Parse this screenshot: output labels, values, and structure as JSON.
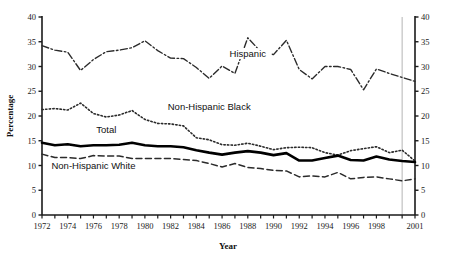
{
  "chart_data": {
    "type": "line",
    "title": "",
    "xlabel": "Year",
    "ylabel": "Percentage",
    "xlim": [
      1972,
      2001
    ],
    "ylim": [
      0,
      40
    ],
    "ytick_step": 5,
    "yticks": [
      0,
      5,
      10,
      15,
      20,
      25,
      30,
      35,
      40
    ],
    "xticks": [
      1972,
      1973,
      1974,
      1975,
      1976,
      1977,
      1978,
      1979,
      1980,
      1981,
      1982,
      1983,
      1984,
      1985,
      1986,
      1987,
      1988,
      1989,
      1990,
      1991,
      1992,
      1993,
      1994,
      1995,
      1996,
      1997,
      1998,
      1999,
      2000,
      2001
    ],
    "xtick_labels": [
      "1972",
      "",
      "1974",
      "",
      "1976",
      "",
      "1978",
      "",
      "1980",
      "",
      "1982",
      "",
      "1984",
      "",
      "1986",
      "",
      "1988",
      "",
      "1990",
      "",
      "1992",
      "",
      "1994",
      "",
      "1996",
      "",
      "1998",
      "",
      "",
      "2001"
    ],
    "grid": false,
    "legend_position": "inline-annotations",
    "dual_axis": true,
    "right_axis_ticks": [
      0,
      5,
      10,
      15,
      20,
      25,
      30,
      35,
      40
    ],
    "break_marker": {
      "x": 2000,
      "color": "#b5b5b5",
      "note": "vertical reference line"
    },
    "x": [
      1972,
      1973,
      1974,
      1975,
      1976,
      1977,
      1978,
      1979,
      1980,
      1981,
      1982,
      1983,
      1984,
      1985,
      1986,
      1987,
      1988,
      1989,
      1990,
      1991,
      1992,
      1993,
      1994,
      1995,
      1996,
      1997,
      1998,
      1999,
      2000,
      2001
    ],
    "series": [
      {
        "name": "Hispanic",
        "style": "dash-dot",
        "color": "#2b2b2b",
        "label_x": 1988,
        "label_y": 32.0,
        "values": [
          34.2,
          33.3,
          32.9,
          29.2,
          31.4,
          33.0,
          33.3,
          33.8,
          35.2,
          33.2,
          31.7,
          31.6,
          29.8,
          27.6,
          30.1,
          28.6,
          35.8,
          33.0,
          32.4,
          35.3,
          29.4,
          27.5,
          30.0,
          30.0,
          29.4,
          25.3,
          29.5,
          28.6,
          27.8,
          27.0
        ]
      },
      {
        "name": "Non-Hispanic Black",
        "style": "dotted",
        "color": "#2b2b2b",
        "label_x": 1985,
        "label_y": 21.2,
        "values": [
          21.3,
          21.5,
          21.2,
          22.6,
          20.5,
          19.8,
          20.2,
          21.1,
          19.3,
          18.5,
          18.4,
          18.0,
          15.6,
          15.2,
          14.2,
          14.1,
          14.5,
          13.9,
          13.2,
          13.6,
          13.7,
          13.6,
          12.6,
          12.1,
          13.0,
          13.4,
          13.8,
          12.6,
          13.1,
          10.9
        ]
      },
      {
        "name": "Total",
        "style": "solid-bold",
        "color": "#000000",
        "label_x": 1977,
        "label_y": 16.5,
        "values": [
          14.6,
          14.1,
          14.3,
          13.9,
          14.1,
          14.1,
          14.2,
          14.6,
          14.1,
          13.9,
          13.9,
          13.7,
          13.1,
          12.6,
          12.2,
          12.6,
          12.9,
          12.6,
          12.1,
          12.5,
          11.0,
          11.0,
          11.5,
          12.0,
          11.1,
          11.0,
          11.8,
          11.2,
          10.9,
          10.7
        ]
      },
      {
        "name": "Non-Hispanic White",
        "style": "dashed",
        "color": "#2b2b2b",
        "label_x": 1976,
        "label_y": 9.3,
        "values": [
          12.3,
          11.6,
          11.6,
          11.4,
          12.0,
          11.9,
          11.9,
          11.4,
          11.4,
          11.4,
          11.4,
          11.2,
          11.0,
          10.4,
          9.7,
          10.4,
          9.6,
          9.4,
          9.0,
          8.9,
          7.7,
          7.9,
          7.7,
          8.6,
          7.3,
          7.6,
          7.7,
          7.3,
          6.9,
          7.3
        ]
      }
    ]
  }
}
